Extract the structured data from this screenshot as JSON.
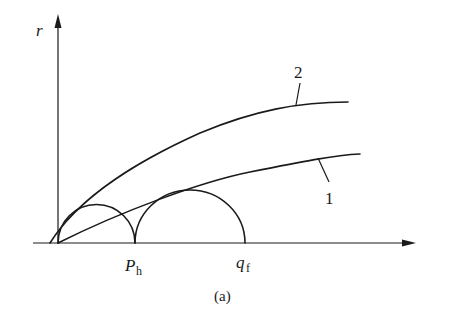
{
  "figure": {
    "caption": "(a)",
    "y_axis_label": "r",
    "x_ticks": {
      "ph_main": "P",
      "ph_sub": "h",
      "qf_main": "q",
      "qf_sub": "f"
    },
    "curves": [
      {
        "id": "1",
        "label": "1",
        "description": "lower envelope curve tangent to circles"
      },
      {
        "id": "2",
        "label": "2",
        "description": "upper curve"
      }
    ],
    "circles": [
      {
        "name": "small-semicircle",
        "from": "origin",
        "to": "P_h"
      },
      {
        "name": "large-semicircle",
        "from": "P_h",
        "to": "q_f"
      }
    ],
    "colors": {
      "ink": "#1a1a1a",
      "background": "#ffffff"
    }
  }
}
